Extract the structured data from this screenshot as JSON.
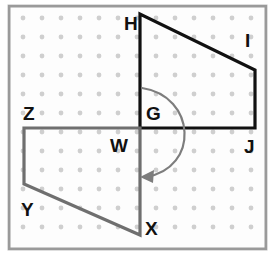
{
  "figure": {
    "width": 278,
    "height": 265,
    "background_color": "#ffffff",
    "frame": {
      "x": 8,
      "y": 5,
      "width": 259,
      "height": 245,
      "border_color": "#9a9a9a",
      "inner_fill": "#fdfdfd"
    },
    "grid": {
      "dot_color": "#cfcfcf",
      "dot_radius": 2.4,
      "spacing": 19,
      "origin_x": 23,
      "origin_y": 18,
      "columns": 13,
      "rows": 12
    },
    "colors": {
      "image_shape": "#111111",
      "preimage_shape": "#6f6f6f",
      "arrow": "#7d7d7d",
      "label": "#111111"
    },
    "shapes": [
      {
        "name": "black-quadrilateral-GHIJ",
        "style": "solid-black",
        "vertex_order": [
          "G",
          "H",
          "I",
          "J"
        ],
        "points": "140,128 140,14 255,70 255,128",
        "closed": true
      },
      {
        "name": "gray-quadrilateral-WZYX",
        "style": "solid-gray",
        "vertex_order": [
          "W",
          "Z",
          "Y",
          "X"
        ],
        "points": "140,128 24,128 24,184 140,235",
        "closed": true
      }
    ],
    "rotation_arrow": {
      "name": "rotation-arc",
      "description": "curved arrow showing 180 degree rotation about point G/W",
      "path": "M 142 88 C 196 96 200 168 146 177",
      "arrowhead": "140,177 154,170 153,183",
      "direction": "clockwise-to-lower-left"
    },
    "labels": [
      {
        "id": "H",
        "text": "H",
        "x": 124,
        "y": 30,
        "anchor": "start"
      },
      {
        "id": "I",
        "text": "I",
        "x": 245,
        "y": 47,
        "anchor": "start"
      },
      {
        "id": "G",
        "text": "G",
        "x": 146,
        "y": 120,
        "anchor": "start"
      },
      {
        "id": "J",
        "text": "J",
        "x": 244,
        "y": 153,
        "anchor": "start"
      },
      {
        "id": "Z",
        "text": "Z",
        "x": 23,
        "y": 120,
        "anchor": "start"
      },
      {
        "id": "W",
        "text": "W",
        "x": 110,
        "y": 152,
        "anchor": "start"
      },
      {
        "id": "Y",
        "text": "Y",
        "x": 21,
        "y": 216,
        "anchor": "start"
      },
      {
        "id": "X",
        "text": "X",
        "x": 145,
        "y": 235,
        "anchor": "start"
      }
    ]
  }
}
